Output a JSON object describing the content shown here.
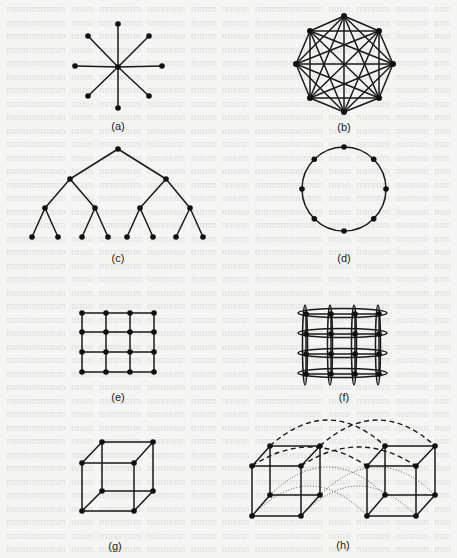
{
  "figure": {
    "panels": [
      {
        "id": "a",
        "label": "(a)",
        "topology": "star"
      },
      {
        "id": "b",
        "label": "(b)",
        "topology": "completely-connected"
      },
      {
        "id": "c",
        "label": "(c)",
        "topology": "binary-tree"
      },
      {
        "id": "d",
        "label": "(d)",
        "topology": "ring"
      },
      {
        "id": "e",
        "label": "(e)",
        "topology": "2d-mesh"
      },
      {
        "id": "f",
        "label": "(f)",
        "topology": "2d-torus"
      },
      {
        "id": "g",
        "label": "(g)",
        "topology": "3-cube"
      },
      {
        "id": "h",
        "label": "(h)",
        "topology": "4-cube"
      }
    ],
    "colors": {
      "ink": "#1a1a1a",
      "paper": "#f5f5f3"
    },
    "star": {
      "center": [
        118,
        67
      ],
      "nodes": [
        [
          118,
          24
        ],
        [
          149,
          36
        ],
        [
          162,
          66
        ],
        [
          149,
          96
        ],
        [
          118,
          108
        ],
        [
          88,
          96
        ],
        [
          75,
          66
        ],
        [
          88,
          36
        ]
      ]
    },
    "complete": {
      "nodes": [
        [
          344,
          16
        ],
        [
          379,
          31
        ],
        [
          393,
          64
        ],
        [
          379,
          98
        ],
        [
          344,
          112
        ],
        [
          310,
          98
        ],
        [
          296,
          64
        ],
        [
          310,
          31
        ]
      ]
    },
    "tree": {
      "levels": [
        [
          [
            118,
            149
          ]
        ],
        [
          [
            70,
            179
          ],
          [
            166,
            179
          ]
        ],
        [
          [
            45,
            208
          ],
          [
            95,
            208
          ],
          [
            140,
            208
          ],
          [
            190,
            208
          ]
        ],
        [
          [
            32,
            237
          ],
          [
            58,
            237
          ],
          [
            82,
            237
          ],
          [
            108,
            237
          ],
          [
            127,
            237
          ],
          [
            153,
            237
          ],
          [
            176,
            237
          ],
          [
            203,
            237
          ]
        ]
      ]
    },
    "ring": {
      "center": [
        344,
        189
      ],
      "radius": 42,
      "node_count": 8
    },
    "mesh": {
      "xs": [
        82,
        106,
        130,
        154
      ],
      "ys": [
        313,
        332,
        352,
        372
      ]
    },
    "torus": {
      "xs": [
        306,
        331,
        355,
        379
      ],
      "ys": [
        314,
        334,
        354,
        374
      ]
    }
  }
}
